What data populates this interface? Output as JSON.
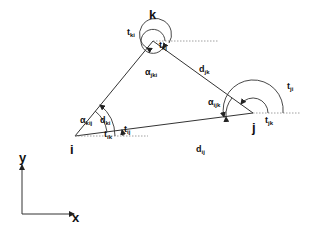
{
  "diagram": {
    "type": "geometry-triangle-diagram",
    "vertices": {
      "i": {
        "label": "i"
      },
      "j": {
        "label": "j"
      },
      "k": {
        "label": "k"
      }
    },
    "edges": {
      "dij": {
        "main": "d",
        "sub": "ij"
      },
      "djk": {
        "main": "d",
        "sub": "jk"
      },
      "dki": {
        "main": "d",
        "sub": "ki"
      }
    },
    "angles": {
      "alpha_kij": {
        "main": "α",
        "sub": "kij"
      },
      "alpha_ijk": {
        "main": "α",
        "sub": "ijk"
      },
      "alpha_jki": {
        "main": "α",
        "sub": "jki"
      }
    },
    "directions": {
      "tij": {
        "main": "t",
        "sub": "ij"
      },
      "tik": {
        "main": "t",
        "sub": "ik"
      },
      "tji": {
        "main": "t",
        "sub": "ji"
      },
      "tjk": {
        "main": "t",
        "sub": "jk"
      },
      "tki": {
        "main": "t",
        "sub": "ki"
      },
      "tkj": {
        "main": "t",
        "sub": "kj"
      }
    },
    "axes": {
      "x": "x",
      "y": "y"
    },
    "colors": {
      "line": "#333333",
      "dotted": "#777777",
      "background": "#ffffff"
    }
  }
}
